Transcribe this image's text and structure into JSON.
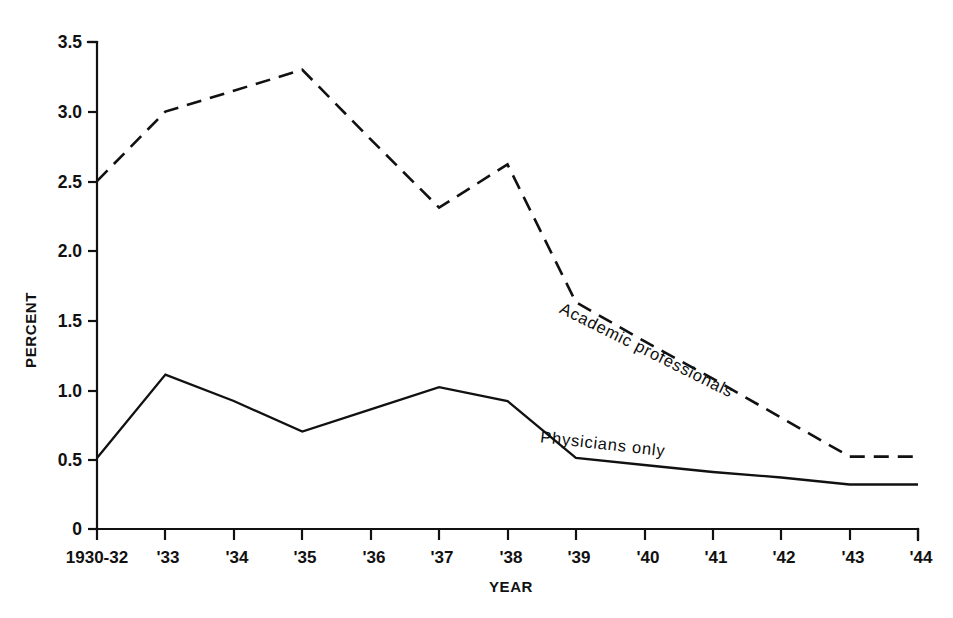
{
  "chart_data": {
    "type": "line",
    "title": "",
    "xlabel": "YEAR",
    "ylabel": "PERCENT",
    "grid": false,
    "legend_position": "inline-along-curves",
    "categories": [
      "1930-32",
      "'33",
      "'34",
      "'35",
      "'36",
      "'37",
      "'38",
      "'39",
      "'40",
      "'41",
      "'42",
      "'43",
      "'44"
    ],
    "xtick_labels": [
      "1930-32",
      "'33",
      "'34",
      "'35",
      "'36",
      "'37",
      "'38",
      "'39",
      "'40",
      "'41",
      "'42",
      "'43",
      "'44"
    ],
    "ytick_labels": [
      "0",
      "0.5",
      "1.0",
      "1.5",
      "2.0",
      "2.5",
      "3.0",
      "3.5"
    ],
    "ytick_values": [
      0,
      0.5,
      1.0,
      1.5,
      2.0,
      2.5,
      3.0,
      3.5
    ],
    "ylim": [
      0,
      3.5
    ],
    "series": [
      {
        "name": "Academic professionals",
        "style": "dashed",
        "color": "#111111",
        "values": [
          2.5,
          3.0,
          3.15,
          3.3,
          2.8,
          2.31,
          2.62,
          1.63,
          1.35,
          1.08,
          0.8,
          0.52,
          0.52
        ]
      },
      {
        "name": "Physicians only",
        "style": "solid",
        "color": "#111111",
        "values": [
          0.51,
          1.11,
          0.92,
          0.7,
          0.86,
          1.02,
          0.92,
          0.51,
          0.46,
          0.41,
          0.37,
          0.32,
          0.32
        ]
      }
    ],
    "annotations": [
      {
        "text": "Academic professionals",
        "rotation": 26.5,
        "x_category": "'40",
        "y_value": 1.25
      },
      {
        "text": "Physicians only",
        "rotation": 6.5,
        "x_category": "'40",
        "y_value": 0.53
      }
    ]
  }
}
